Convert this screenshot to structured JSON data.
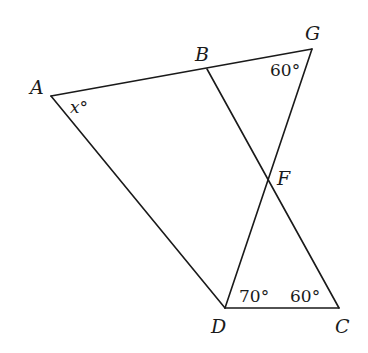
{
  "diagram": {
    "type": "geometry",
    "points": {
      "A": {
        "label": "A",
        "x": 51,
        "y": 96
      },
      "B": {
        "label": "B",
        "x": 207,
        "y": 69
      },
      "G": {
        "label": "G",
        "x": 312,
        "y": 49
      },
      "F": {
        "label": "F",
        "x": 268,
        "y": 179
      },
      "D": {
        "label": "D",
        "x": 225,
        "y": 308
      },
      "C": {
        "label": "C",
        "x": 339,
        "y": 308
      }
    },
    "segments": [
      [
        "A",
        "G"
      ],
      [
        "A",
        "D"
      ],
      [
        "D",
        "C"
      ],
      [
        "D",
        "G"
      ],
      [
        "B",
        "C"
      ]
    ],
    "angles": {
      "A": {
        "text": "x°",
        "vertex": "A"
      },
      "G": {
        "text": "60°",
        "vertex": "G"
      },
      "D": {
        "text": "70°",
        "vertex": "D"
      },
      "C": {
        "text": "60°",
        "vertex": "C"
      }
    }
  }
}
